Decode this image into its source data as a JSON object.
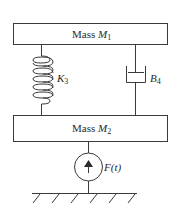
{
  "diagram": {
    "type": "mechanical-system",
    "mass1": {
      "label": "Mass ",
      "symbol": "M",
      "subscript": "1"
    },
    "mass2": {
      "label": "Mass ",
      "symbol": "M",
      "subscript": "2"
    },
    "spring": {
      "symbol": "K",
      "subscript": "3"
    },
    "damper": {
      "symbol": "B",
      "subscript": "4"
    },
    "force": {
      "label": "F(t)",
      "direction": "up"
    },
    "ground": {
      "hatch_count": 6
    },
    "colors": {
      "line": "#3a3a3a",
      "text": "#2a2a2a",
      "background": "#ffffff"
    }
  }
}
